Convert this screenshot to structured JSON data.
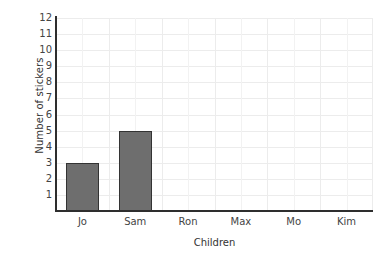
{
  "chart_data": {
    "type": "bar",
    "title": "",
    "categories": [
      "Jo",
      "Sam",
      "Ron",
      "Max",
      "Mo",
      "Kim"
    ],
    "values": [
      3,
      5,
      0,
      0,
      0,
      0
    ],
    "xlabel": "Children",
    "ylabel": "Number of stickers",
    "ylim": [
      0,
      12
    ],
    "yticks": [
      12,
      11,
      10,
      9,
      8,
      7,
      6,
      5,
      4,
      3,
      2,
      1
    ],
    "grid": true,
    "legend": "none",
    "bar_color": "#6e6e6e",
    "bar_edge_color": "#333333",
    "grid_color": "#ececec",
    "axis_color": "#2e2e2e"
  }
}
